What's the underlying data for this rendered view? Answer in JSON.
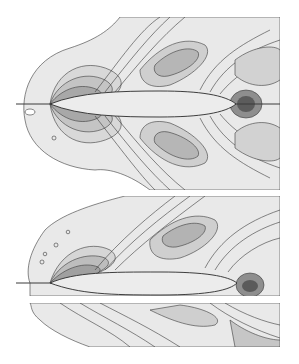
{
  "figure": {
    "panels": [
      {
        "id": "top",
        "body_shape": "symmetric spindle",
        "bounds": {
          "x": 16,
          "y": 17,
          "w": 264,
          "h": 173
        },
        "body": {
          "x0": 50,
          "x1": 236,
          "cy": 104,
          "half_thickness": 12
        },
        "wake_line_y": 104
      },
      {
        "id": "bottom",
        "body_shape": "flat-bottomed asymmetric",
        "bounds": {
          "x": 16,
          "y": 196,
          "w": 264,
          "h": 151
        },
        "body": {
          "x0": 50,
          "x1": 237,
          "top_y": 272,
          "bottom_y": 295
        },
        "gap_band": {
          "y0": 296,
          "y1": 303
        }
      }
    ],
    "colors": {
      "background": "#ffffff",
      "field_light": "#e8e8e8",
      "field_mid": "#c8c8c8",
      "field_dark": "#9a9a9a",
      "contour_line": "#3a3a3a",
      "body_fill": "#ececec"
    }
  }
}
